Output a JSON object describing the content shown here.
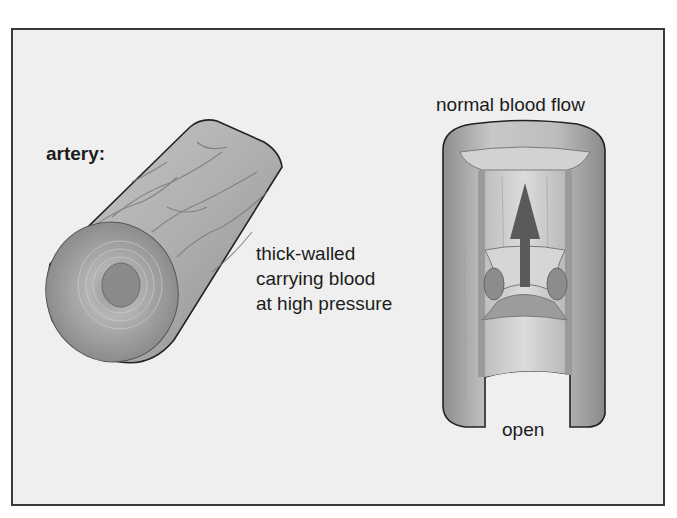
{
  "figure": {
    "background_color": "#efefef",
    "border_color": "#3a3a3a"
  },
  "artery": {
    "title": "artery:",
    "description_lines": [
      "thick-walled",
      "carrying blood",
      "at high pressure"
    ],
    "icon": "artery-cylinder-illustration"
  },
  "vein": {
    "top_label": "normal blood flow",
    "bottom_label": "open",
    "icon": "vein-cutaway-illustration",
    "arrow_icon": "up-arrow-icon",
    "arrow_color": "#5a5a5a"
  }
}
